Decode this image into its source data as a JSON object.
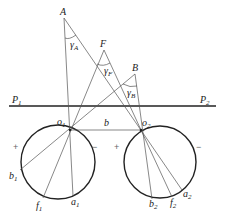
{
  "diagram": {
    "points": {
      "A": {
        "label": "A",
        "x": 64,
        "y": 18
      },
      "F": {
        "label": "F",
        "x": 104,
        "y": 50
      },
      "B": {
        "label": "B",
        "x": 135,
        "y": 74
      },
      "o1": {
        "label": "o",
        "sub": "1",
        "x": 70,
        "y": 130
      },
      "o2": {
        "label": "o",
        "sub": "2",
        "x": 141,
        "y": 130
      },
      "a1": {
        "label": "a",
        "sub": "1",
        "x": 73,
        "y": 196
      },
      "f1": {
        "label": "f",
        "sub": "1",
        "x": 43,
        "y": 198
      },
      "b1": {
        "label": "b",
        "sub": "1",
        "x": 20,
        "y": 170
      },
      "a2": {
        "label": "a",
        "sub": "2",
        "x": 182,
        "y": 190
      },
      "f2": {
        "label": "f",
        "sub": "2",
        "x": 172,
        "y": 197
      },
      "b2": {
        "label": "b",
        "sub": "2",
        "x": 152,
        "y": 199
      }
    },
    "angles": {
      "gammaA": {
        "label": "γ",
        "sub": "A"
      },
      "gammaF": {
        "label": "γ",
        "sub": "F"
      },
      "gammaB": {
        "label": "γ",
        "sub": "B"
      }
    },
    "plane_line": {
      "left_label": "P",
      "left_sub": "1",
      "right_label": "P",
      "right_sub": "2"
    },
    "baseline_label": "b",
    "signs": {
      "c1_left": "+",
      "c1_right": "−",
      "c2_left": "+",
      "c2_right": "−"
    },
    "circles": [
      {
        "name": "circle-1",
        "cx": 58,
        "cy": 162,
        "r": 37
      },
      {
        "name": "circle-2",
        "cx": 160,
        "cy": 162,
        "r": 36
      }
    ]
  }
}
